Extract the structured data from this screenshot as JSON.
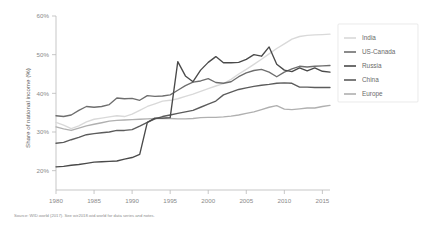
{
  "chart_data": {
    "type": "line",
    "title": "",
    "xlabel": "",
    "ylabel": "Share of national income (%)",
    "xlim": [
      1980,
      2016
    ],
    "ylim": [
      15,
      60
    ],
    "xticks": [
      "1980",
      "1985",
      "1990",
      "1995",
      "2000",
      "2005",
      "2010",
      "2015"
    ],
    "xtick_values": [
      1980,
      1985,
      1990,
      1995,
      2000,
      2005,
      2010,
      2015
    ],
    "yticks": [
      "20%",
      "30%",
      "40%",
      "50%",
      "60%"
    ],
    "ytick_values": [
      20,
      30,
      40,
      50,
      60
    ],
    "grid": false,
    "legend_position": "right",
    "x": [
      1980,
      1981,
      1982,
      1983,
      1984,
      1985,
      1986,
      1987,
      1988,
      1989,
      1990,
      1991,
      1992,
      1993,
      1994,
      1995,
      1996,
      1997,
      1998,
      1999,
      2000,
      2001,
      2002,
      2003,
      2004,
      2005,
      2006,
      2007,
      2008,
      2009,
      2010,
      2011,
      2012,
      2013,
      2014,
      2015,
      2016
    ],
    "series": [
      {
        "name": "India",
        "color": "#d9d9d9",
        "values": [
          32.5,
          31.8,
          30.9,
          31.6,
          32.6,
          33.3,
          33.6,
          33.9,
          34.2,
          34.0,
          34.6,
          35.6,
          36.6,
          37.3,
          38.0,
          38.2,
          38.6,
          39.2,
          39.8,
          40.5,
          41.2,
          41.9,
          42.5,
          43.6,
          45.0,
          46.2,
          47.5,
          48.8,
          50.2,
          51.6,
          52.8,
          54.0,
          54.7,
          55.0,
          55.1,
          55.2,
          55.3
        ]
      },
      {
        "name": "US-Canada",
        "color": "#6e6e6e",
        "values": [
          34.2,
          34.0,
          34.4,
          35.6,
          36.6,
          36.4,
          36.6,
          37.1,
          38.8,
          38.6,
          38.7,
          38.2,
          39.4,
          39.2,
          39.3,
          39.6,
          40.8,
          42.0,
          42.9,
          43.2,
          43.8,
          42.8,
          42.6,
          43.0,
          44.3,
          45.3,
          45.9,
          46.2,
          45.5,
          44.3,
          45.5,
          46.3,
          47.0,
          46.8,
          47.0,
          47.1,
          47.2
        ]
      },
      {
        "name": "Russia",
        "color": "#4a4a4a",
        "values": [
          21.0,
          21.1,
          21.4,
          21.6,
          21.9,
          22.2,
          22.3,
          22.4,
          22.5,
          23.0,
          23.4,
          24.2,
          32.5,
          33.6,
          33.6,
          33.7,
          48.2,
          44.5,
          43.0,
          46.0,
          48.0,
          49.5,
          47.9,
          47.9,
          48.0,
          48.8,
          50.0,
          49.6,
          52.0,
          47.5,
          46.0,
          45.6,
          46.6,
          45.8,
          46.6,
          45.7,
          45.5
        ]
      },
      {
        "name": "China",
        "color": "#5c5c5c",
        "values": [
          27.1,
          27.3,
          28.0,
          28.6,
          29.3,
          29.6,
          29.8,
          30.0,
          30.4,
          30.4,
          30.6,
          31.5,
          32.5,
          33.4,
          34.0,
          34.4,
          34.8,
          35.2,
          35.6,
          36.4,
          37.2,
          38.0,
          39.6,
          40.3,
          41.0,
          41.4,
          41.8,
          42.1,
          42.3,
          42.6,
          42.7,
          42.6,
          41.6,
          41.6,
          41.5,
          41.5,
          41.5
        ]
      },
      {
        "name": "Europe",
        "color": "#b0b0b0",
        "values": [
          31.3,
          30.8,
          30.4,
          31.0,
          31.6,
          32.0,
          32.4,
          32.8,
          33.0,
          33.1,
          33.2,
          33.3,
          33.4,
          33.5,
          33.5,
          33.5,
          33.4,
          33.4,
          33.5,
          33.7,
          33.8,
          33.8,
          33.9,
          34.1,
          34.4,
          34.8,
          35.2,
          35.8,
          36.4,
          36.8,
          35.9,
          35.8,
          36.0,
          36.2,
          36.2,
          36.6,
          36.9
        ]
      }
    ]
  },
  "legend": {
    "entries": [
      {
        "label": "India"
      },
      {
        "label": "US-Canada"
      },
      {
        "label": "Russia"
      },
      {
        "label": "China"
      },
      {
        "label": "Europe"
      }
    ]
  },
  "footnote": {
    "source": "Source: WID.world (2017). See wir2018.wid.world for data series and notes."
  }
}
